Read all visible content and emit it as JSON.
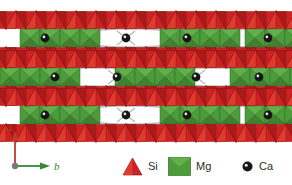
{
  "figure": {
    "background_color": "#ffffff",
    "width": 292,
    "height": 185
  },
  "colors": {
    "si_fill": "#CC2222",
    "si_fill_dark": "#A81B1B",
    "si_fill_light": "#DD3B2E",
    "si_stroke": "#8E1212",
    "mg_fill": "#4E9B3C",
    "mg_fill_dark": "#3F8130",
    "mg_fill_light": "#61B04B",
    "mg_stroke": "#2F6B25",
    "ca_fill": "#161616",
    "ca_highlight": "#e8e8e8",
    "bond_stroke": "#b9b9b9",
    "axis_a_color": "#C0392B",
    "axis_b_color": "#2E8B2E",
    "origin_color": "#7a7a7a",
    "text_color": "#2b2b2b"
  },
  "axes": {
    "a_label": "a",
    "b_label": "b",
    "origin_label": "",
    "a_direction": "up",
    "b_direction": "right"
  },
  "legend": {
    "items": [
      {
        "key": "si",
        "label": "Si",
        "symbol": "triangle",
        "color": "#CC2222"
      },
      {
        "key": "mg",
        "label": "Mg",
        "symbol": "square",
        "color": "#4E9B3C"
      },
      {
        "key": "ca",
        "label": "Ca",
        "symbol": "circle",
        "color": "#161616"
      }
    ]
  },
  "chart_data": {
    "type": "diagram",
    "projection": "a-b plane",
    "structure_rows": [
      {
        "index": 0,
        "y_center": 38,
        "phase": "A",
        "mg_bands_x": [
          30,
          170,
          255
        ],
        "void_bands_x": [
          100,
          225
        ]
      },
      {
        "index": 1,
        "y_center": 77,
        "phase": "B",
        "mg_bands_x": [
          10,
          125,
          240
        ],
        "void_bands_x": [
          65,
          185
        ]
      },
      {
        "index": 2,
        "y_center": 115,
        "phase": "A",
        "mg_bands_x": [
          30,
          170,
          255
        ],
        "void_bands_x": [
          100,
          225
        ]
      }
    ],
    "ca_sites": [
      {
        "x": 45,
        "y": 38
      },
      {
        "x": 126,
        "y": 38
      },
      {
        "x": 187,
        "y": 38
      },
      {
        "x": 268,
        "y": 38
      },
      {
        "x": 55,
        "y": 77
      },
      {
        "x": 117,
        "y": 77
      },
      {
        "x": 196,
        "y": 77
      },
      {
        "x": 259,
        "y": 77
      },
      {
        "x": 45,
        "y": 115
      },
      {
        "x": 126,
        "y": 115
      },
      {
        "x": 187,
        "y": 115
      },
      {
        "x": 268,
        "y": 115
      }
    ],
    "legend_entries": [
      "Si",
      "Mg",
      "Ca"
    ],
    "axis_labels": [
      "a",
      "b"
    ]
  }
}
